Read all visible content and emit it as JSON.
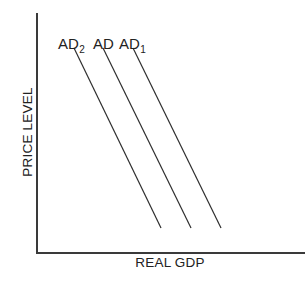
{
  "chart_data": {
    "type": "line",
    "title": "",
    "xlabel": "REAL GDP",
    "ylabel": "PRICE LEVEL",
    "grid": false,
    "ticks": false,
    "colors": {
      "axis": "#3a3a3a",
      "curve": "#2e2e2e",
      "text": "#222222"
    },
    "axes": {
      "origin": [
        37,
        253
      ],
      "y_top": 13,
      "x_right": 305
    },
    "series": [
      {
        "name": "AD2",
        "label_main": "AD",
        "label_sub": "2",
        "label_pos": [
          58,
          49
        ],
        "start": [
          74,
          48
        ],
        "end": [
          161,
          228
        ]
      },
      {
        "name": "AD",
        "label_main": "AD",
        "label_sub": "",
        "label_pos": [
          93,
          49
        ],
        "start": [
          103,
          48
        ],
        "end": [
          191,
          228
        ]
      },
      {
        "name": "AD1",
        "label_main": "AD",
        "label_sub": "1",
        "label_pos": [
          119,
          49
        ],
        "start": [
          133,
          48
        ],
        "end": [
          221,
          228
        ]
      }
    ],
    "relationship": "Three parallel downward-sloping aggregate demand curves; AD2 shifted left of AD, AD1 shifted right of AD"
  },
  "labels": {
    "x_axis": "REAL GDP",
    "y_axis": "PRICE LEVEL"
  }
}
